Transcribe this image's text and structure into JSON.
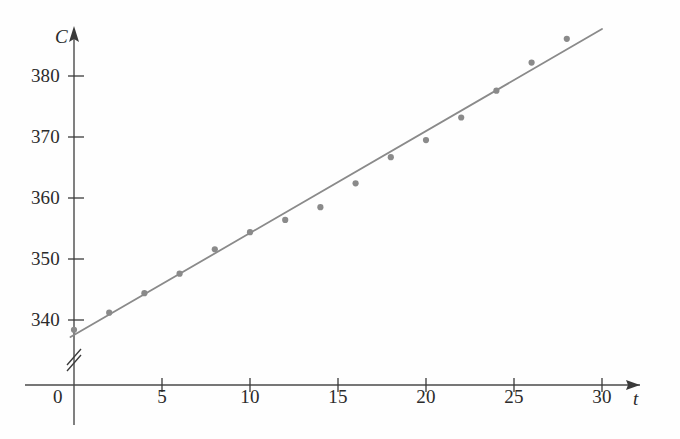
{
  "figure": {
    "background_color": "#fefefe",
    "ink_color": "#3a3a3a",
    "data_color": "#8a8a8a",
    "axis_break_name": "y-axis-break-mark"
  },
  "axes": {
    "x_name": "t",
    "y_name": "C",
    "origin_label": "0",
    "x_ticks": [
      "5",
      "10",
      "15",
      "20",
      "25",
      "30"
    ],
    "y_ticks": [
      "340",
      "350",
      "360",
      "370",
      "380"
    ]
  },
  "chart_data": {
    "type": "scatter",
    "title": "",
    "subtitle": "",
    "xlabel": "t",
    "ylabel": "C",
    "xlim": [
      0,
      32
    ],
    "ylim": [
      336,
      390
    ],
    "grid": false,
    "legend": "none",
    "x_ticks": [
      0,
      5,
      10,
      15,
      20,
      25,
      30
    ],
    "y_ticks": [
      340,
      350,
      360,
      370,
      380
    ],
    "y_axis_break": true,
    "series": [
      {
        "name": "observations",
        "type": "scatter",
        "marker": "circle",
        "color": "#8a8a8a",
        "x": [
          0,
          2,
          4,
          6,
          8,
          10,
          12,
          14,
          16,
          18,
          20,
          22,
          24,
          26,
          28
        ],
        "y": [
          338.4,
          341.2,
          344.4,
          347.6,
          351.6,
          354.4,
          356.4,
          358.5,
          362.4,
          366.7,
          369.5,
          373.2,
          377.6,
          382.2,
          386.1
        ]
      },
      {
        "name": "regression-line",
        "type": "line",
        "color": "#8a8a8a",
        "x": [
          -0.2,
          30.0
        ],
        "y": [
          337.2,
          387.7
        ]
      }
    ]
  }
}
